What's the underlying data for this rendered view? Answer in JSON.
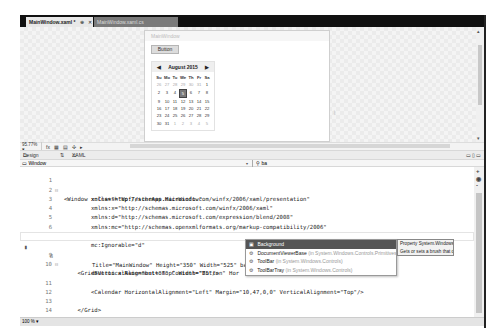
{
  "tabs": [
    {
      "label": "MainWindow.xaml",
      "modified": "*",
      "pin": "⊕",
      "close": "✕",
      "active": true
    },
    {
      "label": "MainWindow.xaml.cs",
      "active": false
    }
  ],
  "designer": {
    "window_title": "MainWindow",
    "button_label": "Button",
    "size_hint": "⌇",
    "calendar": {
      "month_label": "August 2015",
      "prev_icon": "◀",
      "next_icon": "▶",
      "day_headers": [
        "Su",
        "Mo",
        "Tu",
        "We",
        "Th",
        "Fr",
        "Sa"
      ],
      "weeks": [
        [
          "26",
          "27",
          "28",
          "29",
          "30",
          "31",
          "1"
        ],
        [
          "2",
          "3",
          "4",
          "5",
          "6",
          "7",
          "8"
        ],
        [
          "9",
          "10",
          "11",
          "12",
          "13",
          "14",
          "15"
        ],
        [
          "16",
          "17",
          "18",
          "19",
          "20",
          "21",
          "22"
        ],
        [
          "23",
          "24",
          "25",
          "26",
          "27",
          "28",
          "29"
        ],
        [
          "30",
          "31",
          "1",
          "2",
          "3",
          "4",
          "5"
        ]
      ],
      "selected_day": "5"
    }
  },
  "zoom_bar": {
    "zoom_value": "95.77%",
    "zoom_caret": "▾",
    "fx_icon": "fx",
    "grid_icon": "▦",
    "snap_icon": "▤",
    "align_icon": "✣",
    "scroll_right_icon": "▸"
  },
  "split_bar": {
    "design_label": "Design",
    "swap_icon": "⇅",
    "xaml_label": "XAML",
    "pane_icons": "▭▯▭"
  },
  "nav_bar": {
    "element_label": "Window",
    "dropdown_icon": "▾",
    "member_icon": "⚲",
    "member_value": "ba"
  },
  "editor": {
    "lines": [
      {
        "n": "1",
        "text": "<Window x:Class=\"WpfTesterApp.MainWindow\"",
        "fold": "⊟"
      },
      {
        "n": "2",
        "text": "        xmlns=\"http://schemas.microsoft.com/winfx/2006/xaml/presentation\""
      },
      {
        "n": "3",
        "text": "        xmlns:x=\"http://schemas.microsoft.com/winfx/2006/xaml\""
      },
      {
        "n": "4",
        "text": "        xmlns:d=\"http://schemas.microsoft.com/expression/blend/2008\""
      },
      {
        "n": "5",
        "text": "        xmlns:mc=\"http://schemas.openxmlformats.org/markup-compatibility/2006\""
      },
      {
        "n": "6",
        "text": "        xmlns:local=\"clr-namespace:WpfTesterApp\"",
        "dim": true
      },
      {
        "n": "7",
        "text": "        mc:Ignorable=\"d\""
      },
      {
        "n": "8",
        "text": "        Title=\"MainWindow\" Height=\"350\" Width=\"525\" ba",
        "current": true
      },
      {
        "n": "9",
        "text": "    <Grid>",
        "fold": "⊟"
      },
      {
        "n": "10",
        "text": "        <Button x:Name=\"button\" Content=\"Button\" Hor"
      },
      {
        "n": "",
        "text": "          VerticalAlignment=\"Top\" Width=\"75\"/>"
      },
      {
        "n": "11",
        "text": "        <Calendar HorizontalAlignment=\"Left\" Margin=\"10,47,0,0\" VerticalAlignment=\"Top\"/>"
      },
      {
        "n": "12",
        "text": ""
      },
      {
        "n": "13",
        "text": "    </Grid>"
      },
      {
        "n": "14",
        "text": "</Window>"
      }
    ],
    "breakpoint_icon": "▮",
    "scroll_plus": "+",
    "scroll_reset": "◉",
    "scroll_minus": "-"
  },
  "intellisense": {
    "items": [
      {
        "icon": "▣",
        "name": "Background",
        "ns": "",
        "selected": true
      },
      {
        "icon": "⚙",
        "name": "DocumentViewerBase",
        "ns": "(in System.Windows.Controls.Primitives)"
      },
      {
        "icon": "⚙",
        "name": "ToolBar",
        "ns": "(in System.Windows.Controls)"
      },
      {
        "icon": "⚙",
        "name": "ToolBarTray",
        "ns": "(in System.Windows.Controls)"
      }
    ],
    "tooltip_line1": "Property System.Windows.Media.Brush Background",
    "tooltip_line2": "Gets or sets a brush that describes the background"
  },
  "status": {
    "zoom_value": "100 %",
    "zoom_caret": "▾"
  }
}
